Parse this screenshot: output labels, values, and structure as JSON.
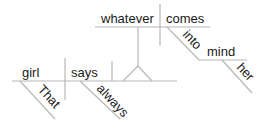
{
  "diagram": {
    "type": "sentence-diagram",
    "sentence": "That girl always says whatever comes into her mind",
    "main_clause": {
      "subject": "girl",
      "subject_modifier": "That",
      "verb": "says",
      "verb_modifier": "always"
    },
    "noun_clause": {
      "subject": "whatever",
      "verb": "comes",
      "preposition": "into",
      "prep_object": "mind",
      "prep_object_modifier": "her"
    },
    "line_color": "#b8b8b8",
    "text_color": "#1a1a1a"
  }
}
